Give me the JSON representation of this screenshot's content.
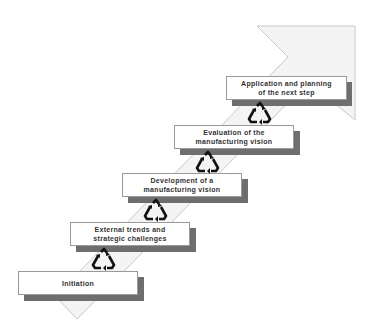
{
  "diagram": {
    "type": "staircase-process",
    "colors": {
      "band_fill": "#f4f4f4",
      "band_stroke": "#c8c8c8",
      "box_fill": "#ffffff",
      "box_border": "#9a9a9a",
      "shadow": "#6e6e6e",
      "text": "#333333",
      "cycle_icon": "#111111"
    },
    "steps": [
      {
        "line1": "Initiation",
        "line2": ""
      },
      {
        "line1": "External trends and",
        "line2": "strategic challenges"
      },
      {
        "line1": "Development of a",
        "line2": "manufacturing vision"
      },
      {
        "line1": "Evaluation of the",
        "line2": "manufacturing vision"
      },
      {
        "line1": "Application and planning",
        "line2": "of the next step"
      }
    ],
    "connectors": [
      {
        "icon": "recycle-cycle-icon",
        "between": [
          0,
          1
        ]
      },
      {
        "icon": "recycle-cycle-icon",
        "between": [
          1,
          2
        ]
      },
      {
        "icon": "recycle-cycle-icon",
        "between": [
          2,
          3
        ]
      },
      {
        "icon": "recycle-cycle-icon",
        "between": [
          3,
          4
        ]
      }
    ]
  }
}
